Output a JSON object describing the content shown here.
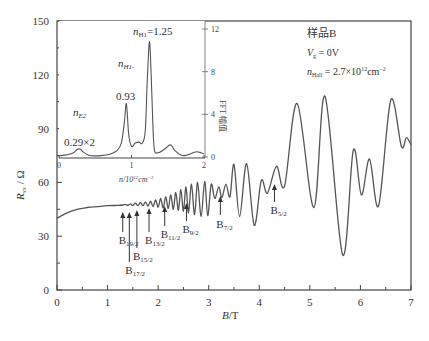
{
  "chart_data": [
    {
      "id": "main",
      "type": "line",
      "title": "",
      "xlabel": "B/T",
      "ylabel": "R_xx / Ω",
      "xlim": [
        0,
        7
      ],
      "ylim": [
        0,
        150
      ],
      "xticks": [
        0,
        1,
        2,
        3,
        4,
        5,
        6,
        7
      ],
      "yticks": [
        0,
        30,
        60,
        90,
        120,
        150
      ],
      "grid": false,
      "series": [
        {
          "name": "R_xx",
          "x": [
            0.0,
            0.2,
            0.4,
            0.6,
            0.8,
            1.0,
            1.2,
            1.3,
            1.35,
            1.4,
            1.45,
            1.5,
            1.55,
            1.6,
            1.65,
            1.7,
            1.75,
            1.8,
            1.85,
            1.9,
            1.95,
            2.0,
            2.05,
            2.1,
            2.15,
            2.2,
            2.25,
            2.3,
            2.35,
            2.4,
            2.45,
            2.5,
            2.55,
            2.6,
            2.66,
            2.72,
            2.78,
            2.85,
            2.92,
            2.98,
            3.05,
            3.12,
            3.2,
            3.26,
            3.34,
            3.42,
            3.5,
            3.61,
            3.75,
            3.9,
            4.04,
            4.16,
            4.34,
            4.5,
            4.75,
            5.08,
            5.3,
            5.65,
            5.86,
            6.02,
            6.18,
            6.36,
            6.6,
            6.81,
            6.91,
            7.0
          ],
          "y": [
            40,
            43,
            45,
            46,
            46.5,
            47,
            47.2,
            47.4,
            47.8,
            47.2,
            48.0,
            47.2,
            48.4,
            47.0,
            48.8,
            47.0,
            49.2,
            46.8,
            49.6,
            46.5,
            50.2,
            46.2,
            51.0,
            45.8,
            52.0,
            45.5,
            53.0,
            45.0,
            54.5,
            44.5,
            56.0,
            44.0,
            57.5,
            43.0,
            59.0,
            42.0,
            60.0,
            41.0,
            60.5,
            41.5,
            59.0,
            51.0,
            57.5,
            51.5,
            59.0,
            52.0,
            70.0,
            41.0,
            70.5,
            36.0,
            61.0,
            54.0,
            69.0,
            58.0,
            104.0,
            46.0,
            108.0,
            19.5,
            78.0,
            53.0,
            73.0,
            47.0,
            106.0,
            80.0,
            85.0,
            81.0
          ]
        }
      ],
      "annotations": [
        {
          "text": "B",
          "sub": "19/2",
          "B": 1.3
        },
        {
          "text": "B",
          "sub": "17/2",
          "B": 1.43
        },
        {
          "text": "B",
          "sub": "15/2",
          "B": 1.58
        },
        {
          "text": "B",
          "sub": "13/2",
          "B": 1.82
        },
        {
          "text": "B",
          "sub": "11/2",
          "B": 2.13
        },
        {
          "text": "B",
          "sub": "9/2",
          "B": 2.56
        },
        {
          "text": "B",
          "sub": "7/2",
          "B": 3.23
        },
        {
          "text": "B",
          "sub": "5/2",
          "B": 4.3
        }
      ]
    },
    {
      "id": "inset",
      "type": "line",
      "xlabel": "n/10¹²cm⁻²",
      "ylabel": "FFT 幅值",
      "xlim": [
        0,
        2
      ],
      "ylim": [
        0,
        12
      ],
      "xticks": [
        0,
        1,
        2
      ],
      "yticks": [
        0,
        4,
        8,
        12
      ],
      "series": [
        {
          "name": "FFT",
          "x": [
            0.0,
            0.1,
            0.2,
            0.25,
            0.29,
            0.33,
            0.4,
            0.5,
            0.6,
            0.7,
            0.8,
            0.86,
            0.9,
            0.93,
            0.96,
            1.0,
            1.05,
            1.1,
            1.15,
            1.19,
            1.22,
            1.25,
            1.28,
            1.31,
            1.36,
            1.45,
            1.52,
            1.55,
            1.6,
            1.68,
            1.75,
            1.85,
            1.9,
            1.96,
            2.0
          ],
          "y": [
            0.1,
            0.2,
            0.4,
            0.7,
            0.75,
            0.5,
            0.2,
            0.1,
            0.15,
            0.25,
            0.6,
            1.3,
            3.2,
            5.0,
            2.2,
            1.0,
            1.3,
            1.4,
            1.3,
            2.5,
            7.5,
            10.8,
            6.0,
            1.0,
            0.4,
            0.7,
            1.1,
            1.1,
            0.6,
            0.2,
            0.15,
            0.4,
            0.5,
            0.4,
            0.3
          ]
        }
      ],
      "annotations": [
        {
          "label": "n_E2",
          "value": "0.29×2"
        },
        {
          "label": "n_H1-",
          "value": "0.93"
        },
        {
          "label": "n_H1=",
          "value": "1.25"
        }
      ]
    }
  ],
  "legend": {
    "sample": "样品B",
    "vg": "V",
    "vg_sub": "g",
    "vg_val": " = 0V",
    "nhall": "n",
    "nhall_sub": "Hall",
    "nhall_val": " = 2.7×10",
    "nhall_exp": "12",
    "nhall_unit": "cm",
    "nhall_unit_exp": "−2"
  },
  "labels": {
    "xlabel_italic": "B",
    "xlabel_rest": "/T",
    "ylabel_R": "R",
    "ylabel_sub": "xx",
    "ylabel_rest": " / Ω",
    "inset_xlabel": "n/10",
    "inset_xlabel_exp": "12",
    "inset_xlabel_unit": "cm",
    "inset_xlabel_unit_exp": "−2",
    "inset_ylabel": "FFT 幅值",
    "nE2": "n",
    "nE2_sub": "E2",
    "nE2_val": "0.29×2",
    "nH1a": "n",
    "nH1a_sub": "H1-",
    "nH1a_val": "0.93",
    "nH1b": "n",
    "nH1b_sub": "H1",
    "nH1b_val": "=1.25"
  }
}
